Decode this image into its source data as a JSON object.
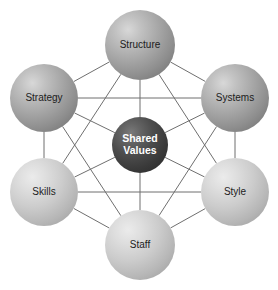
{
  "diagram": {
    "type": "network-diagram",
    "canvas": {
      "width": 278,
      "height": 290
    },
    "background_color": "#ffffff",
    "line_color": "#6f6f6f",
    "nodes": [
      {
        "id": "structure",
        "label": "Structure",
        "cx": 140,
        "cy": 45,
        "r": 35,
        "style": "outer-mid",
        "fill": "#a0a0a0",
        "text_color": "#1c1c1c"
      },
      {
        "id": "strategy",
        "label": "Strategy",
        "cx": 44,
        "cy": 98,
        "r": 34,
        "style": "outer-mid",
        "fill": "#a0a0a0",
        "text_color": "#1c1c1c"
      },
      {
        "id": "systems",
        "label": "Systems",
        "cx": 235,
        "cy": 98,
        "r": 34,
        "style": "outer-mid",
        "fill": "#a0a0a0",
        "text_color": "#1c1c1c"
      },
      {
        "id": "shared-values",
        "label": "Shared\nValues",
        "label_line1": "Shared",
        "label_line2": "Values",
        "cx": 140,
        "cy": 145,
        "r": 28,
        "style": "center",
        "fill": "#3a3a3a",
        "text_color": "#ffffff"
      },
      {
        "id": "skills",
        "label": "Skills",
        "cx": 44,
        "cy": 192,
        "r": 34,
        "style": "outer-light",
        "fill": "#c8c8c8",
        "text_color": "#1c1c1c"
      },
      {
        "id": "style",
        "label": "Style",
        "cx": 235,
        "cy": 192,
        "r": 34,
        "style": "outer-light",
        "fill": "#c8c8c8",
        "text_color": "#1c1c1c"
      },
      {
        "id": "staff",
        "label": "Staff",
        "cx": 140,
        "cy": 245,
        "r": 35,
        "style": "outer-light",
        "fill": "#c8c8c8",
        "text_color": "#1c1c1c"
      }
    ],
    "links": [
      {
        "from": "structure",
        "to": "strategy"
      },
      {
        "from": "structure",
        "to": "systems"
      },
      {
        "from": "strategy",
        "to": "skills"
      },
      {
        "from": "systems",
        "to": "style"
      },
      {
        "from": "skills",
        "to": "staff"
      },
      {
        "from": "style",
        "to": "staff"
      },
      {
        "from": "strategy",
        "to": "systems"
      },
      {
        "from": "skills",
        "to": "style"
      },
      {
        "from": "structure",
        "to": "skills"
      },
      {
        "from": "structure",
        "to": "style"
      },
      {
        "from": "staff",
        "to": "strategy"
      },
      {
        "from": "staff",
        "to": "systems"
      },
      {
        "from": "shared-values",
        "to": "structure"
      },
      {
        "from": "shared-values",
        "to": "strategy"
      },
      {
        "from": "shared-values",
        "to": "systems"
      },
      {
        "from": "shared-values",
        "to": "skills"
      },
      {
        "from": "shared-values",
        "to": "style"
      },
      {
        "from": "shared-values",
        "to": "staff"
      }
    ]
  }
}
